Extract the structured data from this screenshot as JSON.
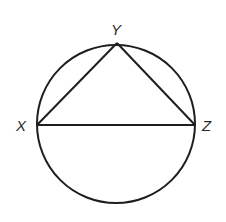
{
  "diagram": {
    "type": "inscribed-triangle-in-circle",
    "circle": {
      "cx": 116,
      "cy": 124,
      "r": 79
    },
    "points": [
      {
        "name": "X",
        "label": "X",
        "x": 37,
        "y": 125
      },
      {
        "name": "Y",
        "label": "Y",
        "x": 117,
        "y": 43
      },
      {
        "name": "Z",
        "label": "Z",
        "x": 195,
        "y": 125
      }
    ],
    "segments": [
      "XY",
      "YZ",
      "XZ"
    ],
    "stroke_color": "#1e1e1e",
    "label_color": "#2a2a2a"
  }
}
